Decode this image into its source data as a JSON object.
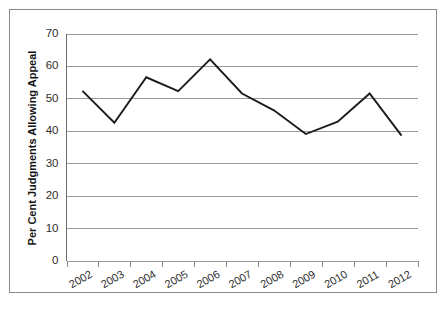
{
  "chart_data": {
    "type": "line",
    "title": "",
    "subtitle": "",
    "xlabel": "",
    "ylabel": "Per Cent Judgments Allowing Appeal",
    "categories": [
      "2002",
      "2003",
      "2004",
      "2005",
      "2006",
      "2007",
      "2008",
      "2009",
      "2010",
      "2011",
      "2012"
    ],
    "values": [
      52.3,
      42.5,
      56.5,
      52.2,
      62.0,
      51.5,
      46.3,
      39.0,
      42.8,
      51.5,
      38.5
    ],
    "series": [
      {
        "name": "Per Cent Judgments Allowing Appeal",
        "values": [
          52.3,
          42.5,
          56.5,
          52.2,
          62.0,
          51.5,
          46.3,
          39.0,
          42.8,
          51.5,
          38.5
        ]
      }
    ],
    "ylim": [
      0,
      70
    ],
    "ytick_labels": [
      "0",
      "10",
      "20",
      "30",
      "40",
      "50",
      "60",
      "70"
    ],
    "ytick_values": [
      0,
      10,
      20,
      30,
      40,
      50,
      60,
      70
    ],
    "grid": true,
    "grid_axis": "y",
    "legend": false,
    "legend_position": "none",
    "line_color": "#1b1b1b",
    "gridline_color": "#9b9b9b",
    "background_color": "#ffffff",
    "border_color": "#8a8a8a",
    "markers": false,
    "xtick_label_rotation": -30
  }
}
